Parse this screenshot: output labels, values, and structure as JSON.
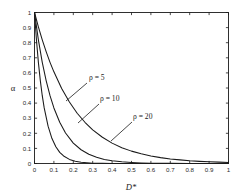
{
  "chart_data": {
    "type": "line",
    "title": "",
    "xlabel": "D*",
    "ylabel": "α",
    "xlim": [
      0,
      1
    ],
    "ylim": [
      0,
      1
    ],
    "grid": false,
    "legend": "annotations-on-curves",
    "xticks": [
      "0",
      "0.1",
      "0.2",
      "0.3",
      "0.4",
      "0.5",
      "0.6",
      "0.7",
      "0.8",
      "0.9",
      "1"
    ],
    "xtick_values": [
      0,
      0.1,
      0.2,
      0.3,
      0.4,
      0.5,
      0.6,
      0.7,
      0.8,
      0.9,
      1
    ],
    "yticks": [
      "0",
      "0.1",
      "0.2",
      "0.3",
      "0.4",
      "0.5",
      "0.6",
      "0.7",
      "0.8",
      "0.9",
      "1"
    ],
    "ytick_values": [
      0,
      0.1,
      0.2,
      0.3,
      0.4,
      0.5,
      0.6,
      0.7,
      0.8,
      0.9,
      1
    ],
    "line_color": "#1a1a1a",
    "series": [
      {
        "name": "ρ = 5",
        "rho": 5,
        "x": [
          0,
          0.02,
          0.04,
          0.06,
          0.08,
          0.1,
          0.14,
          0.18,
          0.22,
          0.26,
          0.3,
          0.35,
          0.4,
          0.45,
          0.5,
          0.55,
          0.6,
          0.65,
          0.7,
          0.75,
          0.8,
          0.85,
          0.9,
          0.95,
          1
        ],
        "y": [
          1.0,
          0.905,
          0.819,
          0.741,
          0.67,
          0.607,
          0.497,
          0.407,
          0.333,
          0.273,
          0.223,
          0.174,
          0.135,
          0.105,
          0.082,
          0.064,
          0.05,
          0.039,
          0.03,
          0.024,
          0.018,
          0.014,
          0.011,
          0.009,
          0.007
        ]
      },
      {
        "name": "ρ = 10",
        "rho": 10,
        "x": [
          0,
          0.02,
          0.04,
          0.06,
          0.08,
          0.1,
          0.13,
          0.16,
          0.2,
          0.24,
          0.28,
          0.32,
          0.36,
          0.4,
          0.45,
          0.5,
          0.55,
          0.6,
          0.7,
          0.8,
          0.9,
          1
        ],
        "y": [
          1.0,
          0.819,
          0.67,
          0.549,
          0.449,
          0.368,
          0.273,
          0.202,
          0.135,
          0.091,
          0.061,
          0.041,
          0.027,
          0.018,
          0.011,
          0.007,
          0.004,
          0.002,
          0.001,
          0.0,
          0.0,
          0.0
        ]
      },
      {
        "name": "ρ = 20",
        "rho": 20,
        "x": [
          0,
          0.01,
          0.02,
          0.03,
          0.04,
          0.05,
          0.07,
          0.09,
          0.11,
          0.13,
          0.15,
          0.18,
          0.21,
          0.24,
          0.27,
          0.3,
          0.35,
          0.4,
          0.5,
          0.6,
          0.8,
          1
        ],
        "y": [
          1.0,
          0.819,
          0.67,
          0.549,
          0.449,
          0.368,
          0.247,
          0.165,
          0.111,
          0.074,
          0.05,
          0.027,
          0.015,
          0.008,
          0.005,
          0.002,
          0.001,
          0.0,
          0.0,
          0.0,
          0.0,
          0.0
        ]
      }
    ],
    "annotations": [
      {
        "label": "ρ = 5",
        "text_x": 89,
        "text_y": 80,
        "leader": [
          87,
          83,
          66,
          101
        ]
      },
      {
        "label": "ρ = 10",
        "text_x": 100,
        "text_y": 101,
        "leader": [
          99,
          104,
          78,
          123
        ]
      },
      {
        "label": "ρ = 20",
        "text_x": 133,
        "text_y": 119,
        "leader": [
          132,
          122,
          111,
          141
        ]
      }
    ]
  }
}
